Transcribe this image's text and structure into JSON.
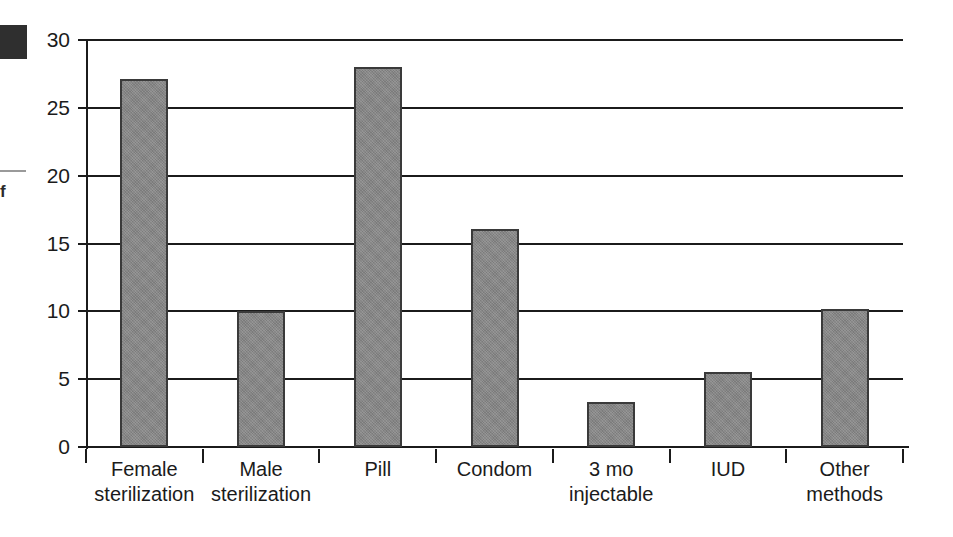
{
  "artifacts": {
    "margin_glyph": "f"
  },
  "chart_data": {
    "type": "bar",
    "title": "",
    "subtitle": "",
    "xlabel": "",
    "ylabel": "",
    "categories": [
      "Female sterilization",
      "Male sterilization",
      "Pill",
      "Condom",
      "3 mo injectable",
      "IUD",
      "Other methods"
    ],
    "category_lines": [
      [
        "Female",
        "sterilization"
      ],
      [
        "Male",
        "sterilization"
      ],
      [
        "Pill",
        ""
      ],
      [
        "Condom",
        ""
      ],
      [
        "3 mo",
        "injectable"
      ],
      [
        "IUD",
        ""
      ],
      [
        "Other",
        "methods"
      ]
    ],
    "values": [
      27.1,
      10.0,
      28.0,
      16.1,
      3.3,
      5.5,
      10.2
    ],
    "ylim": [
      0,
      30
    ],
    "yticks": [
      0,
      5,
      10,
      15,
      20,
      25,
      30
    ],
    "ytick_labels": [
      "0",
      "5",
      "10",
      "15",
      "20",
      "25",
      "30"
    ],
    "grid": true,
    "legend": "none",
    "bar_color": "#878787",
    "bar_border_color": "#3a3a3a",
    "axis_color": "#1b1b1b"
  }
}
